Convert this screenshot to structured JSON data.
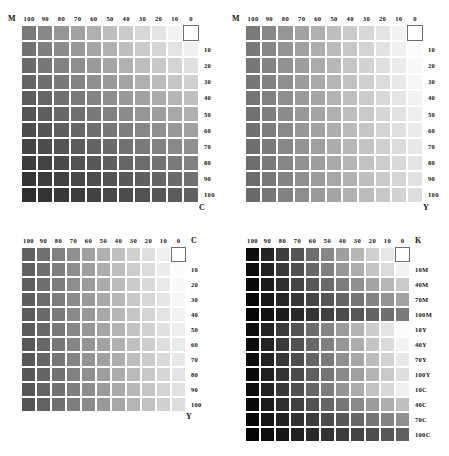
{
  "document": {
    "kind": "cmyk-process-color-chart",
    "rendering": "grayscale",
    "background": "#ffffff",
    "ink_text_color": "#111111",
    "gap_color": "#ffffff",
    "white_patch_border": "#6d6d6d"
  },
  "scales": {
    "percent_desc": [
      "100",
      "90",
      "80",
      "70",
      "60",
      "50",
      "40",
      "30",
      "20",
      "10",
      "0"
    ],
    "row_percent_desc": [
      "",
      "10",
      "20",
      "30",
      "40",
      "50",
      "60",
      "70",
      "80",
      "90",
      "100"
    ],
    "overprint_rows": [
      "",
      "10M",
      "40M",
      "70M",
      "100M",
      "10Y",
      "40Y",
      "70Y",
      "100Y",
      "10C",
      "40C",
      "70C",
      "100C"
    ]
  },
  "charts": [
    {
      "id": "chart-m-c",
      "position": "top-left",
      "column_axis": "M",
      "row_axis": "C",
      "corner_tag": "M",
      "head_end_tag": "",
      "foot_tag": "C",
      "columns": [
        "100",
        "90",
        "80",
        "70",
        "60",
        "50",
        "40",
        "30",
        "20",
        "10",
        "0"
      ],
      "rows": [
        "",
        "10",
        "20",
        "30",
        "40",
        "50",
        "60",
        "70",
        "80",
        "90",
        "100"
      ],
      "col_values": [
        100,
        90,
        80,
        70,
        60,
        50,
        40,
        30,
        20,
        10,
        0
      ],
      "row_values": [
        0,
        10,
        20,
        30,
        40,
        50,
        60,
        70,
        80,
        90,
        100
      ]
    },
    {
      "id": "chart-m-y",
      "position": "top-right",
      "column_axis": "M",
      "row_axis": "Y",
      "corner_tag": "M",
      "head_end_tag": "",
      "foot_tag": "Y",
      "columns": [
        "100",
        "90",
        "80",
        "70",
        "60",
        "50",
        "40",
        "30",
        "20",
        "10",
        "0"
      ],
      "rows": [
        "",
        "10",
        "20",
        "30",
        "40",
        "50",
        "60",
        "70",
        "80",
        "90",
        "100"
      ],
      "col_values": [
        100,
        90,
        80,
        70,
        60,
        50,
        40,
        30,
        20,
        10,
        0
      ],
      "row_values": [
        0,
        10,
        20,
        30,
        40,
        50,
        60,
        70,
        80,
        90,
        100
      ]
    },
    {
      "id": "chart-c-y",
      "position": "bottom-left",
      "column_axis": "C",
      "row_axis": "Y",
      "corner_tag": "",
      "head_end_tag": "C",
      "foot_tag": "Y",
      "columns": [
        "100",
        "90",
        "80",
        "70",
        "60",
        "50",
        "40",
        "30",
        "20",
        "10",
        "0"
      ],
      "rows": [
        "",
        "10",
        "20",
        "30",
        "40",
        "50",
        "60",
        "70",
        "80",
        "90",
        "100"
      ],
      "col_values": [
        100,
        90,
        80,
        70,
        60,
        50,
        40,
        30,
        20,
        10,
        0
      ],
      "row_values": [
        0,
        10,
        20,
        30,
        40,
        50,
        60,
        70,
        80,
        90,
        100
      ]
    },
    {
      "id": "chart-k-overprint",
      "position": "bottom-right",
      "column_axis": "K",
      "row_axis": "overprint",
      "corner_tag": "",
      "head_end_tag": "K",
      "foot_tag": "",
      "columns": [
        "100",
        "90",
        "80",
        "70",
        "60",
        "50",
        "40",
        "30",
        "20",
        "10",
        "0"
      ],
      "rows": [
        "",
        "10M",
        "40M",
        "70M",
        "100M",
        "10Y",
        "40Y",
        "70Y",
        "100Y",
        "10C",
        "40C",
        "70C",
        "100C"
      ],
      "col_values": [
        100,
        90,
        80,
        70,
        60,
        50,
        40,
        30,
        20,
        10,
        0
      ],
      "row_overprints": [
        {
          "ink": "none",
          "pct": 0
        },
        {
          "ink": "M",
          "pct": 10
        },
        {
          "ink": "M",
          "pct": 40
        },
        {
          "ink": "M",
          "pct": 70
        },
        {
          "ink": "M",
          "pct": 100
        },
        {
          "ink": "Y",
          "pct": 10
        },
        {
          "ink": "Y",
          "pct": 40
        },
        {
          "ink": "Y",
          "pct": 70
        },
        {
          "ink": "Y",
          "pct": 100
        },
        {
          "ink": "C",
          "pct": 10
        },
        {
          "ink": "C",
          "pct": 40
        },
        {
          "ink": "C",
          "pct": 70
        },
        {
          "ink": "C",
          "pct": 100
        }
      ]
    }
  ],
  "ink_density": {
    "C": 0.62,
    "M": 0.52,
    "Y": 0.13,
    "K": 0.95
  },
  "geometry": {
    "cell_top": 16.2,
    "cell_bottom": 15.0,
    "quadrant_positions": [
      {
        "left": 8,
        "top": 10
      },
      {
        "left": 232,
        "top": 10
      },
      {
        "left": 8,
        "top": 232
      },
      {
        "left": 232,
        "top": 232
      }
    ]
  }
}
